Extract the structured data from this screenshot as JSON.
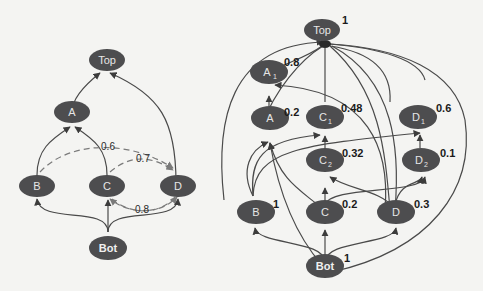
{
  "left_diagram": {
    "nodes": [
      {
        "id": "Top",
        "label": "Top"
      },
      {
        "id": "A",
        "label": "A"
      },
      {
        "id": "B",
        "label": "B"
      },
      {
        "id": "C",
        "label": "C"
      },
      {
        "id": "D",
        "label": "D"
      },
      {
        "id": "Bot",
        "label": "Bot"
      }
    ],
    "dashed_edge_labels": [
      "0.6",
      "0.7",
      "0.8"
    ]
  },
  "right_diagram": {
    "nodes": [
      {
        "id": "Top",
        "label": "Top",
        "sub": "",
        "weight": "1"
      },
      {
        "id": "A1",
        "label": "A",
        "sub": "1",
        "weight": "0.8"
      },
      {
        "id": "A",
        "label": "A",
        "sub": "",
        "weight": "0.2"
      },
      {
        "id": "C1",
        "label": "C",
        "sub": "1",
        "weight": "0.48"
      },
      {
        "id": "C2",
        "label": "C",
        "sub": "2",
        "weight": "0.32"
      },
      {
        "id": "D1",
        "label": "D",
        "sub": "1",
        "weight": "0.6"
      },
      {
        "id": "D2",
        "label": "D",
        "sub": "2",
        "weight": "0.1"
      },
      {
        "id": "B",
        "label": "B",
        "sub": "",
        "weight": "1"
      },
      {
        "id": "C",
        "label": "C",
        "sub": "",
        "weight": "0.2"
      },
      {
        "id": "D",
        "label": "D",
        "sub": "",
        "weight": "0.3"
      },
      {
        "id": "Bot",
        "label": "Bot",
        "sub": "",
        "weight": "1"
      }
    ]
  },
  "colors": {
    "node_fill": "#4d4d4f",
    "edge": "#4a4a4a",
    "dashed_edge": "#7a7a7a"
  }
}
